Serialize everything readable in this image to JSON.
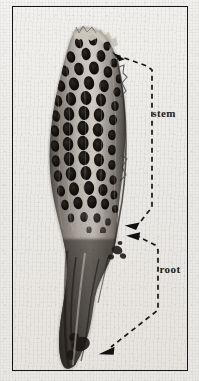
{
  "figure": {
    "kind": "scanned-halftone-photograph",
    "background_color": "#ece9e5",
    "frame_color": "#151515",
    "ink_color": "#1a1a1a"
  },
  "frame": {
    "x": 12,
    "y": 6,
    "width": 176,
    "height": 365,
    "border_width": 1
  },
  "specimen": {
    "name": "specimen",
    "description": "Upright elongated specimen, upper portion covered in rows of dark oval pits forming a honeycomb lattice, lower portion smooth and tapering to a dark root tip",
    "bounds": {
      "x": 28,
      "y": 24,
      "width": 100,
      "height": 340
    },
    "tone_dark": "#1d1b19",
    "tone_mid": "#6f6a64",
    "tone_light": "#d9d5cf"
  },
  "annotations": [
    {
      "id": "stem",
      "label": "stem",
      "label_x": 151,
      "label_y": 108,
      "arrow_tip": {
        "x": 112,
        "y": 54
      },
      "second_arrow_tip": {
        "x": 126,
        "y": 226
      },
      "leader_style": "dashed",
      "leader_color": "#1a1a1a"
    },
    {
      "id": "root",
      "label": "root",
      "label_x": 157,
      "label_y": 264,
      "arrow_tip": {
        "x": 128,
        "y": 238
      },
      "second_arrow_tip": {
        "x": 98,
        "y": 356
      },
      "leader_style": "dashed",
      "leader_color": "#1a1a1a"
    }
  ]
}
